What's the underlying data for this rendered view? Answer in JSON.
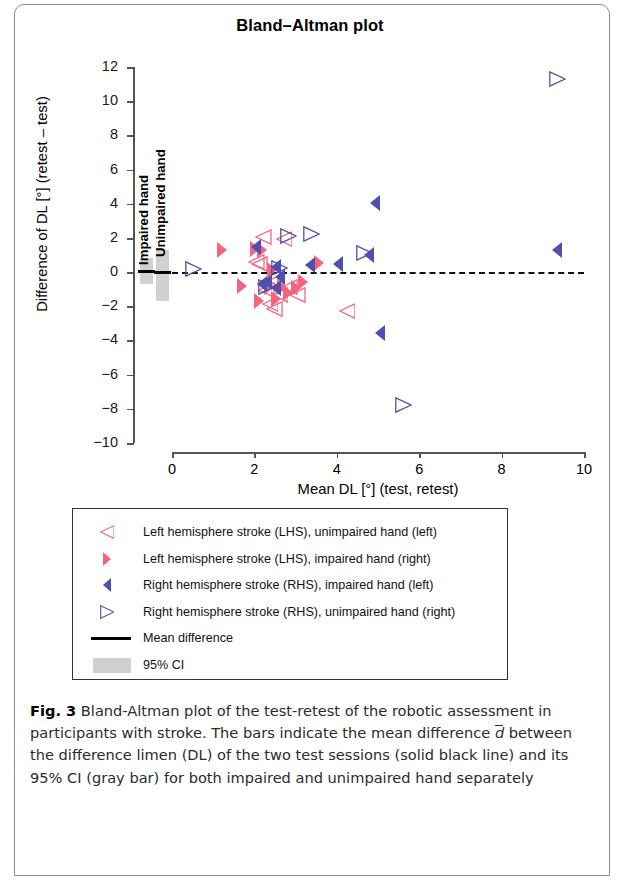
{
  "figure": {
    "label": "Fig. 3",
    "caption_text": " Bland-Altman plot of the test-retest of the robotic assessment in participants with stroke. The bars indicate the mean difference ",
    "caption_dbar": "d",
    "caption_rest": " between the difference limen (DL) of the two test sessions (solid black line) and its 95% CI (gray bar) for both impaired and unimpaired hand separately"
  },
  "chart_data": {
    "type": "scatter",
    "title": "Bland–Altman plot",
    "xlabel": "Mean DL [°] (test, retest)",
    "ylabel": "Difference of DL [°] (retest – test)",
    "xlim": [
      0,
      10
    ],
    "ylim": [
      -10,
      12
    ],
    "xticks": [
      0,
      2,
      4,
      6,
      8,
      10
    ],
    "yticks": [
      12,
      10,
      8,
      6,
      4,
      2,
      0,
      -2,
      -4,
      -6,
      -8,
      -10
    ],
    "xtick_labels": [
      "0",
      "2",
      "4",
      "6",
      "8",
      "10"
    ],
    "ytick_labels": [
      "12",
      "10",
      "8",
      "6",
      "4",
      "2",
      "0",
      "-2",
      "-4",
      "-6",
      "-8",
      "-10"
    ],
    "grid": false,
    "reference_line": {
      "y": 0,
      "style": "dashed",
      "color": "#111111"
    },
    "colors": {
      "lhs": "#F4647E",
      "rhs": "#4F4FB0",
      "ci_bar": "#cfcfcf",
      "mean_line": "#000000"
    },
    "ci_bars": [
      {
        "label": "Impaired hand",
        "x": -0.62,
        "mean": 0.05,
        "ci_low": -0.72,
        "ci_high": 0.82
      },
      {
        "label": "Unimpaired hand",
        "x": -0.22,
        "mean": -0.05,
        "ci_low": -1.72,
        "ci_high": 1.3
      }
    ],
    "series": [
      {
        "name": "Left hemisphere stroke (LHS), unimpaired hand (left)",
        "marker": "triangle-left-open",
        "color": "#F4647E",
        "points": [
          [
            2.22,
            2.05
          ],
          [
            2.12,
            0.45
          ],
          [
            2.52,
            -0.55
          ],
          [
            2.62,
            -1.35
          ],
          [
            2.38,
            -1.85
          ],
          [
            2.85,
            -0.9
          ],
          [
            3.05,
            -1.35
          ],
          [
            2.05,
            0.6
          ],
          [
            2.3,
            -1.05
          ],
          [
            4.25,
            -2.3
          ],
          [
            2.72,
            1.95
          ],
          [
            2.48,
            -2.15
          ]
        ]
      },
      {
        "name": "Left hemisphere stroke (LHS), impaired hand (right)",
        "marker": "triangle-right-filled",
        "color": "#F4647E",
        "points": [
          [
            1.22,
            1.3
          ],
          [
            2.02,
            1.35
          ],
          [
            2.18,
            1.3
          ],
          [
            1.7,
            -0.8
          ],
          [
            2.35,
            -0.85
          ],
          [
            2.68,
            -0.85
          ],
          [
            2.52,
            -1.55
          ],
          [
            3.02,
            -0.95
          ],
          [
            3.58,
            0.55
          ],
          [
            3.18,
            -0.6
          ],
          [
            2.82,
            -1.2
          ],
          [
            2.1,
            -1.7
          ],
          [
            2.42,
            0.15
          ]
        ]
      },
      {
        "name": "Right hemisphere stroke (RHS), impaired hand (left)",
        "marker": "triangle-left-filled",
        "color": "#4F4FB0",
        "points": [
          [
            2.05,
            1.45
          ],
          [
            2.52,
            0.3
          ],
          [
            3.35,
            0.4
          ],
          [
            4.02,
            0.45
          ],
          [
            4.92,
            4.05
          ],
          [
            9.35,
            1.3
          ],
          [
            4.78,
            1.0
          ],
          [
            2.3,
            -0.6
          ],
          [
            2.52,
            -0.95
          ],
          [
            2.18,
            -0.7
          ],
          [
            5.05,
            -3.55
          ],
          [
            2.62,
            -0.3
          ]
        ]
      },
      {
        "name": "Right hemisphere stroke (RHS), unimpaired hand (right)",
        "marker": "triangle-right-open",
        "color": "#4F4FB0",
        "points": [
          [
            0.52,
            0.2
          ],
          [
            2.82,
            2.1
          ],
          [
            3.38,
            2.2
          ],
          [
            4.68,
            1.1
          ],
          [
            9.35,
            11.3
          ],
          [
            2.6,
            0.25
          ],
          [
            5.62,
            -7.8
          ],
          [
            2.28,
            -0.85
          ]
        ]
      }
    ]
  },
  "legend": {
    "items": [
      {
        "label": "Left hemisphere stroke (LHS), unimpaired hand (left)",
        "glyph": "triangle-left-open",
        "color": "#F4647E"
      },
      {
        "label": "Left hemisphere stroke (LHS), impaired hand (right)",
        "glyph": "triangle-right-filled",
        "color": "#F4647E"
      },
      {
        "label": "Right hemisphere stroke (RHS), impaired hand (left)",
        "glyph": "triangle-left-filled",
        "color": "#4F4FB0"
      },
      {
        "label": "Right hemisphere stroke (RHS), unimpaired hand (right)",
        "glyph": "triangle-right-open",
        "color": "#4F4FB0"
      },
      {
        "label": "Mean difference",
        "glyph": "solid-line",
        "color": "#000000"
      },
      {
        "label": "95% CI",
        "glyph": "gray-swatch",
        "color": "#cfcfcf"
      }
    ]
  }
}
